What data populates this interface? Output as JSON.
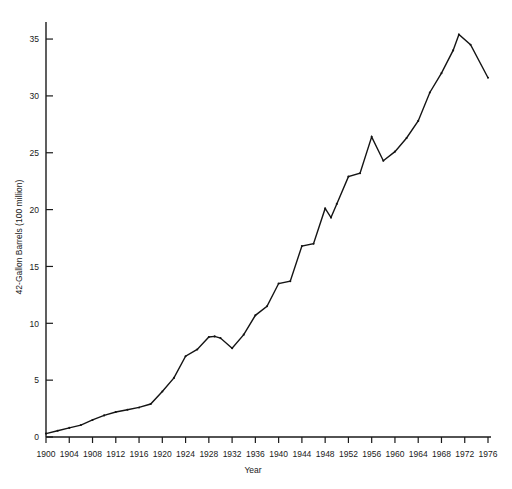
{
  "chart_data": {
    "type": "line",
    "title": "",
    "xlabel": "Year",
    "ylabel": "42-Gallon Barrels (100 million)",
    "xlim": [
      1900,
      1976
    ],
    "ylim": [
      0,
      36.5
    ],
    "grid": false,
    "legend": null,
    "xticks": [
      1900,
      1904,
      1908,
      1912,
      1916,
      1920,
      1924,
      1928,
      1932,
      1936,
      1940,
      1944,
      1948,
      1952,
      1956,
      1960,
      1964,
      1968,
      1972,
      1976
    ],
    "xtick_labels": [
      "1900",
      "1904",
      "1908",
      "1912",
      "1916",
      "1920",
      "1924",
      "1928",
      "1932",
      "1936",
      "1940",
      "1944",
      "1948",
      "1952",
      "1956",
      "1960",
      "1964",
      "1968",
      "1972",
      "1976"
    ],
    "yticks": [
      0,
      5,
      10,
      15,
      20,
      25,
      30,
      35
    ],
    "ytick_labels": [
      "0",
      "5",
      "10",
      "15",
      "20",
      "25",
      "30",
      "35"
    ],
    "series": [
      {
        "name": "U.S. Crude Oil Production",
        "color": "#141414",
        "x": [
          1900,
          1902,
          1904,
          1906,
          1908,
          1910,
          1912,
          1914,
          1916,
          1918,
          1920,
          1922,
          1924,
          1926,
          1928,
          1929,
          1930,
          1932,
          1934,
          1936,
          1938,
          1940,
          1942,
          1944,
          1946,
          1948,
          1949,
          1950,
          1952,
          1954,
          1956,
          1958,
          1960,
          1962,
          1964,
          1966,
          1968,
          1970,
          1971,
          1973,
          1976
        ],
        "y": [
          0.3,
          0.55,
          0.8,
          1.05,
          1.5,
          1.9,
          2.2,
          2.4,
          2.6,
          2.9,
          4.0,
          5.2,
          7.1,
          7.7,
          8.8,
          8.85,
          8.7,
          7.8,
          9.0,
          10.7,
          11.5,
          13.5,
          13.7,
          16.8,
          17.0,
          20.1,
          19.3,
          20.5,
          22.9,
          23.2,
          26.4,
          24.3,
          25.1,
          26.3,
          27.8,
          30.3,
          32.0,
          34.0,
          35.4,
          34.5,
          31.6
        ],
        "units": "100 million 42-gallon barrels"
      }
    ]
  },
  "axes": {
    "x_axis_name": "year-axis",
    "y_axis_name": "production-axis"
  }
}
